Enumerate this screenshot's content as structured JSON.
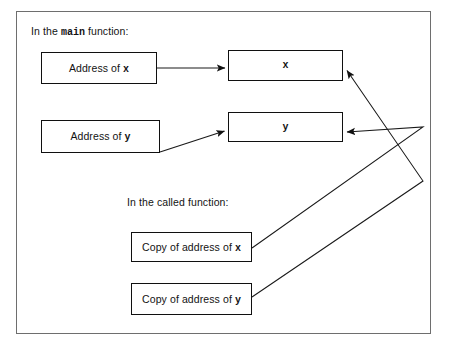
{
  "figure": {
    "frame": {
      "stroke": "#6e6e6e"
    },
    "captions": {
      "main": {
        "prefix": "In the ",
        "code": "main",
        "suffix": " function:"
      },
      "called": {
        "text": "In the called function:"
      }
    },
    "nodes": {
      "address_of_x": {
        "prefix": "Address of ",
        "code": "x",
        "suffix": ""
      },
      "address_of_y": {
        "prefix": "Address of ",
        "code": "y",
        "suffix": ""
      },
      "var_x": {
        "label": "x"
      },
      "var_y": {
        "label": "y"
      },
      "copy_of_address_of_x": {
        "prefix": "Copy of address of ",
        "code": "x",
        "suffix": ""
      },
      "copy_of_address_of_y": {
        "prefix": "Copy of address of ",
        "code": "y",
        "suffix": ""
      }
    },
    "colors": {
      "box_stroke": "#101010",
      "line": "#1a1a1a",
      "text": "#131313",
      "background": "#ffffff"
    },
    "connectors": [
      {
        "name": "address-of-x-to-x",
        "from": "address_of_x",
        "to": "var_x",
        "points": [
          [
            157,
            68
          ],
          [
            225,
            68
          ]
        ],
        "arrowhead": "end"
      },
      {
        "name": "address-of-y-to-y",
        "from": "address_of_y",
        "to": "var_y",
        "points": [
          [
            160,
            152
          ],
          [
            225,
            131
          ]
        ],
        "arrowhead": "end"
      },
      {
        "name": "copy-of-address-of-y-to-x",
        "from": "copy_of_address_of_y",
        "to": "var_x",
        "points": [
          [
            252,
            297
          ],
          [
            423,
            181
          ],
          [
            346,
            70
          ]
        ],
        "arrowhead": "end"
      },
      {
        "name": "copy-of-address-of-x-to-y",
        "from": "copy_of_address_of_x",
        "to": "var_y",
        "points": [
          [
            252,
            248
          ],
          [
            423,
            127
          ],
          [
            346,
            132
          ]
        ],
        "arrowhead": "end"
      }
    ]
  }
}
